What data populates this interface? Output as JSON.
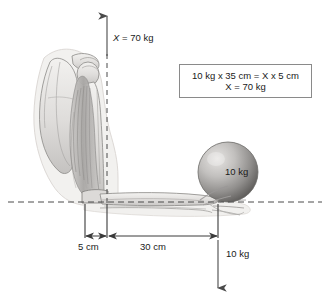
{
  "figure": {
    "background_color": "#ffffff",
    "ink_color": "#1a1a1a",
    "line_color": "#555555"
  },
  "equation_box": {
    "line1": "10 kg x 35 cm = X x 5 cm",
    "line2": "X = 70 kg",
    "line1_parts": {
      "a": "10 kg x 35 cm = ",
      "var": "X",
      "b": " x 5 cm"
    },
    "line2_parts": {
      "var": "X",
      "b": " = 70 kg"
    },
    "border_color": "#8a8a8a"
  },
  "labels": {
    "muscle_force": {
      "var": "X",
      "text": " = 70 kg"
    },
    "ball_weight": "10 kg",
    "load_force": "10 kg",
    "dim_short": "5 cm",
    "dim_long": "30 cm"
  },
  "anatomy": {
    "parts": [
      "scapula",
      "humerus",
      "clavicle-head",
      "biceps-muscle",
      "elbow-joint",
      "radius",
      "ulna",
      "hand",
      "soft-tissue-outline"
    ],
    "bone_fill": "#e4e2e0",
    "bone_stroke": "#8c8a88",
    "muscle_fill": "#bdbbb9",
    "soft_tissue_fill": "#efeeec"
  },
  "ball": {
    "label": "10 kg",
    "center_x": 228,
    "center_y": 172,
    "radius": 30,
    "fill_light": "#d8d6d4",
    "fill_dark": "#6e6c6a"
  },
  "axes": {
    "vertical_line_x": 107,
    "horizontal_line_y": 202,
    "arrow_top_y": 16,
    "arrow_bottom_y": 290,
    "dash_pattern": "6 4"
  },
  "dimensions": {
    "ticks_x": [
      85,
      107,
      218
    ],
    "arrow_row_y": 236,
    "tick_top_y": 202,
    "tick_bottom_y": 240
  }
}
